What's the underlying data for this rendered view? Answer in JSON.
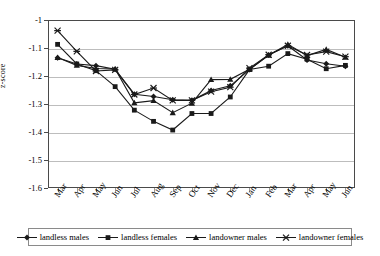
{
  "chart_data": {
    "type": "line",
    "title": "",
    "subtitle": "",
    "xlabel": "",
    "ylabel": "z-score",
    "ylim": [
      -1.6,
      -1.0
    ],
    "yticks": [
      "-1",
      "-1.1",
      "-1.2",
      "-1.3",
      "-1.4",
      "-1.5",
      "-1.6"
    ],
    "ytick_values": [
      -1.0,
      -1.1,
      -1.2,
      -1.3,
      -1.4,
      -1.5,
      -1.6
    ],
    "grid": true,
    "grid_axis": "y",
    "legend_position": "bottom",
    "categories": [
      "Mar",
      "Apr",
      "May",
      "Jun",
      "Jul",
      "Aug",
      "Sep",
      "Oct",
      "Nov",
      "Dec",
      "Jan",
      "Feb",
      "Mar",
      "Apr",
      "May",
      "Jun"
    ],
    "series": [
      {
        "name": "landless males",
        "marker": "diamond",
        "color": "#1a1a1a",
        "values": [
          -1.135,
          -1.157,
          -1.163,
          -1.176,
          -1.265,
          -1.273,
          -1.285,
          -1.287,
          -1.252,
          -1.235,
          -1.177,
          -1.125,
          -1.092,
          -1.143,
          -1.156,
          -1.165
        ]
      },
      {
        "name": "landless females",
        "marker": "square",
        "color": "#1a1a1a",
        "values": [
          -1.087,
          -1.157,
          -1.181,
          -1.238,
          -1.322,
          -1.362,
          -1.393,
          -1.334,
          -1.334,
          -1.275,
          -1.177,
          -1.165,
          -1.12,
          -1.14,
          -1.174,
          -1.162
        ]
      },
      {
        "name": "landowner males",
        "marker": "triangle",
        "color": "#1a1a1a",
        "values": [
          -1.134,
          -1.162,
          -1.173,
          -1.175,
          -1.296,
          -1.288,
          -1.331,
          -1.297,
          -1.213,
          -1.212,
          -1.176,
          -1.126,
          -1.087,
          -1.127,
          -1.105,
          -1.133
        ]
      },
      {
        "name": "landowner females",
        "marker": "cross",
        "color": "#1a1a1a",
        "values": [
          -1.038,
          -1.112,
          -1.182,
          -1.178,
          -1.266,
          -1.243,
          -1.287,
          -1.287,
          -1.256,
          -1.24,
          -1.172,
          -1.124,
          -1.092,
          -1.125,
          -1.113,
          -1.131
        ]
      }
    ]
  },
  "legend": {
    "items": [
      {
        "label": "landless males",
        "marker": "diamond"
      },
      {
        "label": "landless females",
        "marker": "square"
      },
      {
        "label": "landowner males",
        "marker": "triangle"
      },
      {
        "label": "landowner females",
        "marker": "cross"
      }
    ]
  }
}
